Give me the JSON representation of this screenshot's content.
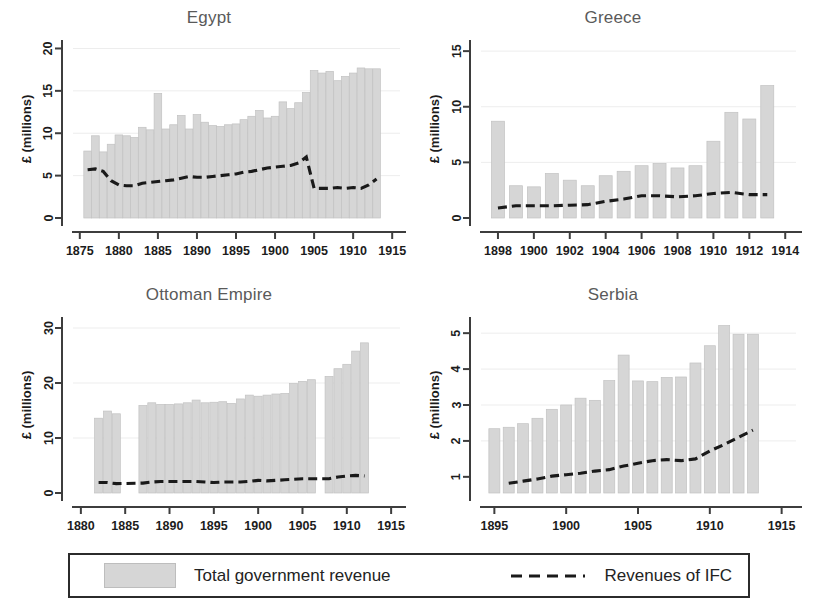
{
  "figure": {
    "background": "#ffffff",
    "bar_color": "#d6d6d6",
    "bar_edge_color": "#c2c2c2",
    "line_color": "#1a1a1a",
    "axis_color": "#3d3d3d"
  },
  "legend": {
    "bars_label": "Total government revenue",
    "line_label": "Revenues of IFC",
    "bars_swatch_name": "legend-bar-swatch",
    "line_swatch_name": "legend-dashed-line-swatch"
  },
  "chart_data": [
    {
      "id": "egypt",
      "type": "bar",
      "title": "Egypt",
      "xlabel": "",
      "ylabel": "£ (millions)",
      "ylim": [
        0,
        21
      ],
      "yticks": [
        0,
        5,
        10,
        15,
        20
      ],
      "ytick_labels": [
        "0",
        "5",
        "10",
        "15",
        "20"
      ],
      "xlim": [
        1874,
        1916
      ],
      "xticks": [
        1875,
        1880,
        1885,
        1890,
        1895,
        1900,
        1905,
        1910,
        1915
      ],
      "xtick_labels": [
        "1875",
        "1880",
        "1885",
        "1890",
        "1895",
        "1900",
        "1905",
        "1910",
        "1915"
      ],
      "grid": false,
      "series": [
        {
          "name": "Total government revenue",
          "kind": "bar",
          "x": [
            1876,
            1877,
            1878,
            1879,
            1880,
            1881,
            1882,
            1883,
            1884,
            1885,
            1886,
            1887,
            1888,
            1889,
            1890,
            1891,
            1892,
            1893,
            1894,
            1895,
            1896,
            1897,
            1898,
            1899,
            1900,
            1901,
            1902,
            1903,
            1904,
            1905,
            1906,
            1907,
            1908,
            1909,
            1910,
            1911,
            1912,
            1913
          ],
          "values": [
            7.9,
            9.7,
            7.8,
            8.7,
            9.8,
            9.7,
            9.5,
            10.7,
            10.4,
            14.7,
            10.5,
            11.0,
            12.1,
            10.5,
            12.2,
            11.3,
            10.9,
            10.8,
            11.0,
            11.1,
            11.6,
            12.0,
            12.7,
            11.8,
            12.0,
            13.7,
            12.9,
            13.6,
            14.8,
            17.4,
            17.1,
            17.3,
            16.2,
            16.7,
            17.1,
            17.7,
            17.6,
            17.6
          ]
        },
        {
          "name": "Revenues of IFC",
          "kind": "line",
          "x": [
            1876,
            1877,
            1878,
            1879,
            1880,
            1881,
            1882,
            1883,
            1884,
            1885,
            1886,
            1887,
            1888,
            1889,
            1890,
            1891,
            1892,
            1893,
            1894,
            1895,
            1896,
            1897,
            1898,
            1899,
            1900,
            1901,
            1902,
            1903,
            1904,
            1905,
            1906,
            1907,
            1908,
            1909,
            1910,
            1911,
            1912,
            1913
          ],
          "values": [
            5.7,
            5.8,
            5.5,
            4.4,
            3.9,
            3.8,
            3.8,
            4.1,
            4.2,
            4.3,
            4.4,
            4.5,
            4.7,
            4.9,
            4.8,
            4.8,
            4.9,
            5.0,
            5.1,
            5.2,
            5.4,
            5.5,
            5.7,
            5.9,
            6.0,
            6.1,
            6.2,
            6.5,
            7.2,
            3.5,
            3.5,
            3.5,
            3.6,
            3.5,
            3.6,
            3.5,
            3.9,
            4.6
          ]
        }
      ]
    },
    {
      "id": "greece",
      "type": "bar",
      "title": "Greece",
      "xlabel": "",
      "ylabel": "£ (millions)",
      "ylim": [
        0,
        16
      ],
      "yticks": [
        0,
        5,
        10,
        15
      ],
      "ytick_labels": [
        "0",
        "5",
        "10",
        "15"
      ],
      "xlim": [
        1897,
        1914.6
      ],
      "xticks": [
        1898,
        1900,
        1902,
        1904,
        1906,
        1908,
        1910,
        1912,
        1914
      ],
      "xtick_labels": [
        "1898",
        "1900",
        "1902",
        "1904",
        "1906",
        "1908",
        "1910",
        "1912",
        "1914"
      ],
      "grid": false,
      "series": [
        {
          "name": "Total government revenue",
          "kind": "bar",
          "x": [
            1898,
            1899,
            1900,
            1901,
            1902,
            1903,
            1904,
            1905,
            1906,
            1907,
            1908,
            1909,
            1910,
            1911,
            1912,
            1913
          ],
          "values": [
            8.7,
            2.9,
            2.8,
            4.0,
            3.4,
            2.9,
            3.8,
            4.2,
            4.7,
            4.9,
            4.5,
            4.7,
            6.9,
            9.5,
            8.9,
            11.9
          ]
        },
        {
          "name": "Revenues of IFC",
          "kind": "line",
          "x": [
            1898,
            1899,
            1900,
            1901,
            1902,
            1903,
            1904,
            1905,
            1906,
            1907,
            1908,
            1909,
            1910,
            1911,
            1912,
            1913
          ],
          "values": [
            0.9,
            1.1,
            1.1,
            1.1,
            1.15,
            1.2,
            1.5,
            1.7,
            2.0,
            2.0,
            1.9,
            2.0,
            2.2,
            2.3,
            2.1,
            2.1
          ]
        }
      ]
    },
    {
      "id": "ottoman-empire",
      "type": "bar",
      "title": "Ottoman Empire",
      "xlabel": "",
      "ylabel": "£ (millions)",
      "ylim": [
        0,
        32
      ],
      "yticks": [
        0,
        10,
        20,
        30
      ],
      "ytick_labels": [
        "0",
        "10",
        "20",
        "30"
      ],
      "xlim": [
        1879,
        1916
      ],
      "xticks": [
        1880,
        1885,
        1890,
        1895,
        1900,
        1905,
        1910,
        1915
      ],
      "xtick_labels": [
        "1880",
        "1885",
        "1890",
        "1895",
        "1900",
        "1905",
        "1910",
        "1915"
      ],
      "grid": false,
      "series": [
        {
          "name": "Total government revenue",
          "kind": "bar",
          "x": [
            1882,
            1883,
            1884,
            1887,
            1888,
            1889,
            1890,
            1891,
            1892,
            1893,
            1894,
            1895,
            1896,
            1897,
            1898,
            1899,
            1900,
            1901,
            1902,
            1903,
            1904,
            1905,
            1906,
            1908,
            1909,
            1910,
            1911,
            1912
          ],
          "values": [
            13.6,
            14.9,
            14.4,
            15.9,
            16.4,
            16.1,
            16.1,
            16.2,
            16.4,
            16.9,
            16.4,
            16.5,
            16.6,
            16.3,
            17.1,
            17.8,
            17.6,
            17.8,
            18.0,
            18.1,
            19.9,
            20.3,
            20.6,
            21.2,
            22.6,
            23.4,
            25.8,
            27.3
          ]
        },
        {
          "name": "Revenues of IFC",
          "kind": "line",
          "x": [
            1882,
            1883,
            1884,
            1887,
            1888,
            1889,
            1890,
            1891,
            1892,
            1893,
            1894,
            1895,
            1896,
            1897,
            1898,
            1899,
            1900,
            1901,
            1902,
            1903,
            1904,
            1905,
            1906,
            1908,
            1909,
            1910,
            1911,
            1912
          ],
          "values": [
            1.9,
            1.9,
            1.7,
            1.8,
            2.0,
            2.1,
            2.1,
            2.1,
            2.1,
            2.1,
            2.0,
            1.9,
            2.0,
            2.0,
            2.0,
            2.1,
            2.3,
            2.2,
            2.3,
            2.4,
            2.5,
            2.6,
            2.6,
            2.6,
            2.9,
            3.1,
            3.2,
            3.1
          ]
        }
      ]
    },
    {
      "id": "serbia",
      "type": "bar",
      "title": "Serbia",
      "xlabel": "",
      "ylabel": "£ (millions)",
      "ylim": [
        0.55,
        5.45
      ],
      "yticks": [
        1,
        2,
        3,
        4,
        5
      ],
      "ytick_labels": [
        "1",
        "2",
        "3",
        "4",
        "5"
      ],
      "xlim": [
        1894,
        1916
      ],
      "xticks": [
        1895,
        1900,
        1905,
        1910,
        1915
      ],
      "xtick_labels": [
        "1895",
        "1900",
        "1905",
        "1910",
        "1915"
      ],
      "grid": false,
      "series": [
        {
          "name": "Total government revenue",
          "kind": "bar",
          "x": [
            1895,
            1896,
            1897,
            1898,
            1899,
            1900,
            1901,
            1902,
            1903,
            1904,
            1905,
            1906,
            1907,
            1908,
            1909,
            1910,
            1911,
            1912,
            1913
          ],
          "values": [
            2.34,
            2.38,
            2.48,
            2.63,
            2.88,
            3.0,
            3.19,
            3.13,
            3.68,
            4.39,
            3.67,
            3.65,
            3.77,
            3.78,
            4.17,
            4.65,
            5.21,
            4.97,
            4.97
          ]
        },
        {
          "name": "Revenues of IFC",
          "kind": "line",
          "x": [
            1896,
            1897,
            1898,
            1899,
            1900,
            1901,
            1902,
            1903,
            1904,
            1905,
            1906,
            1907,
            1908,
            1909,
            1910,
            1911,
            1912,
            1913
          ],
          "values": [
            0.82,
            0.88,
            0.94,
            1.02,
            1.06,
            1.1,
            1.16,
            1.2,
            1.3,
            1.38,
            1.45,
            1.48,
            1.45,
            1.5,
            1.72,
            1.9,
            2.1,
            2.3
          ]
        }
      ]
    }
  ]
}
